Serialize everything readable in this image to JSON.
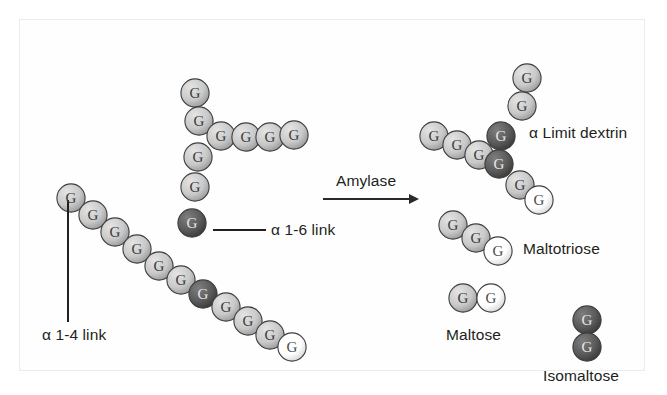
{
  "figure": {
    "background": "#ffffff",
    "border_color": "#ebebeb"
  },
  "colors": {
    "glucose_light": "#c9c9c9",
    "glucose_light_highlight": "#e4e4e4",
    "glucose_light_shadow": "#9a9a9a",
    "glucose_white": "#ffffff",
    "glucose_dark": "#5a5a5a",
    "glucose_dark_highlight": "#7e7e7e",
    "outline": "#3d3d3d",
    "text": "#231f20",
    "arrow": "#2a2a2a"
  },
  "monomer_label": "G",
  "reaction": {
    "enzyme_label": "Amylase",
    "arrow_name": "reaction-arrow"
  },
  "labels": {
    "alpha_1_4": "α 1-4 link",
    "alpha_1_6": "α 1-6 link",
    "limit_dextrin": "α Limit dextrin",
    "maltotriose": "Maltotriose",
    "maltose": "Maltose",
    "isomaltose": "Isomaltose"
  },
  "chart_data": {
    "type": "diagram",
    "substrate": {
      "name": "Starch (branched glucan)",
      "total_units": 20,
      "alpha_1_6_branch_units": 2,
      "reducing_end_units": 1,
      "segments": [
        {
          "name": "main-diagonal-chain",
          "units": 11,
          "shades": [
            "light",
            "light",
            "light",
            "light",
            "light",
            "light",
            "dark",
            "light",
            "light",
            "light",
            "white"
          ]
        },
        {
          "name": "vertical-branch-column",
          "units": 5,
          "shades": [
            "light",
            "light",
            "light",
            "light",
            "dark"
          ]
        },
        {
          "name": "horizontal-branch-arm",
          "units": 4,
          "shades": [
            "light",
            "light",
            "light",
            "light"
          ]
        }
      ]
    },
    "products": [
      {
        "name": "α Limit dextrin",
        "units": 8,
        "dark_units": 2,
        "white_units": 1
      },
      {
        "name": "Maltotriose",
        "units": 3,
        "dark_units": 0,
        "white_units": 1
      },
      {
        "name": "Maltose",
        "units": 2,
        "dark_units": 0,
        "white_units": 1
      },
      {
        "name": "Isomaltose",
        "units": 2,
        "dark_units": 2,
        "white_units": 0
      }
    ]
  },
  "substrate_units": [
    {
      "name": "substrate-main-1",
      "x": 36,
      "y": 163,
      "shade": "light"
    },
    {
      "name": "substrate-main-2",
      "x": 58,
      "y": 180,
      "shade": "light"
    },
    {
      "name": "substrate-main-3",
      "x": 80,
      "y": 197,
      "shade": "light"
    },
    {
      "name": "substrate-main-4",
      "x": 102,
      "y": 214,
      "shade": "light"
    },
    {
      "name": "substrate-main-5",
      "x": 124,
      "y": 231,
      "shade": "light"
    },
    {
      "name": "substrate-main-6",
      "x": 146,
      "y": 245,
      "shade": "light"
    },
    {
      "name": "substrate-branch-point-lower",
      "x": 168,
      "y": 259,
      "shade": "dark"
    },
    {
      "name": "substrate-main-8",
      "x": 191,
      "y": 272,
      "shade": "light"
    },
    {
      "name": "substrate-main-9",
      "x": 213,
      "y": 286,
      "shade": "light"
    },
    {
      "name": "substrate-main-10",
      "x": 235,
      "y": 300,
      "shade": "light"
    },
    {
      "name": "substrate-main-11-reducing-end",
      "x": 257,
      "y": 312,
      "shade": "white"
    },
    {
      "name": "substrate-col-1",
      "x": 160,
      "y": 58,
      "shade": "light"
    },
    {
      "name": "substrate-col-2",
      "x": 164,
      "y": 86,
      "shade": "light"
    },
    {
      "name": "substrate-col-3",
      "x": 163,
      "y": 122,
      "shade": "light"
    },
    {
      "name": "substrate-col-4",
      "x": 160,
      "y": 152,
      "shade": "light"
    },
    {
      "name": "substrate-branch-point-upper",
      "x": 157,
      "y": 188,
      "shade": "dark"
    },
    {
      "name": "substrate-arm-1",
      "x": 186,
      "y": 101,
      "shade": "light"
    },
    {
      "name": "substrate-arm-2",
      "x": 211,
      "y": 102,
      "shade": "light"
    },
    {
      "name": "substrate-arm-3",
      "x": 235,
      "y": 102,
      "shade": "light"
    },
    {
      "name": "substrate-arm-4",
      "x": 259,
      "y": 100,
      "shade": "light"
    }
  ],
  "dextrin_units": [
    {
      "name": "dextrin-arm-1",
      "x": 399,
      "y": 101,
      "shade": "light"
    },
    {
      "name": "dextrin-arm-2",
      "x": 422,
      "y": 110,
      "shade": "light"
    },
    {
      "name": "dextrin-arm-3",
      "x": 444,
      "y": 120,
      "shade": "light"
    },
    {
      "name": "dextrin-branch-upper",
      "x": 466,
      "y": 101,
      "shade": "dark"
    },
    {
      "name": "dextrin-branch-lower",
      "x": 464,
      "y": 129,
      "shade": "dark"
    },
    {
      "name": "dextrin-top-1",
      "x": 487,
      "y": 71,
      "shade": "light"
    },
    {
      "name": "dextrin-top-2",
      "x": 492,
      "y": 43,
      "shade": "light"
    },
    {
      "name": "dextrin-low-1",
      "x": 485,
      "y": 150,
      "shade": "light"
    },
    {
      "name": "dextrin-low-2-reducing-end",
      "x": 504,
      "y": 165,
      "shade": "white"
    }
  ],
  "maltotriose_units": [
    {
      "name": "maltotriose-1",
      "x": 418,
      "y": 190,
      "shade": "light"
    },
    {
      "name": "maltotriose-2",
      "x": 441,
      "y": 203,
      "shade": "light"
    },
    {
      "name": "maltotriose-3-reducing-end",
      "x": 463,
      "y": 216,
      "shade": "white"
    }
  ],
  "maltose_units": [
    {
      "name": "maltose-1",
      "x": 428,
      "y": 263,
      "shade": "light"
    },
    {
      "name": "maltose-2-reducing-end",
      "x": 456,
      "y": 263,
      "shade": "white"
    }
  ],
  "isomaltose_units": [
    {
      "name": "isomaltose-1",
      "x": 552,
      "y": 285,
      "shade": "dark"
    },
    {
      "name": "isomaltose-2",
      "x": 552,
      "y": 312,
      "shade": "dark"
    }
  ]
}
